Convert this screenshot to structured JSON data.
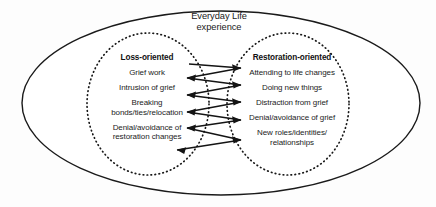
{
  "diagram": {
    "title": "Everyday Life\nexperience",
    "outer_container_name": "everyday-life-experience",
    "oscillation_label": "oscillation",
    "colors": {
      "stroke": "#1a1a1a",
      "background": "#fdfdfd",
      "text": "#1a1a1a"
    },
    "columns": [
      {
        "id": "loss-oriented",
        "heading": "Loss-oriented",
        "items": [
          "Grief work",
          "Intrusion of grief",
          "Breaking\nbonds/ties/relocation",
          "Denial/avoidance of\nrestoration changes"
        ]
      },
      {
        "id": "restoration-oriented",
        "heading": "Restoration-oriented",
        "items": [
          "Attending to life changes",
          "Doing new things",
          "Distraction from grief",
          "Denial/avoidance of grief",
          "New roles/identities/\nrelationships"
        ]
      }
    ]
  }
}
